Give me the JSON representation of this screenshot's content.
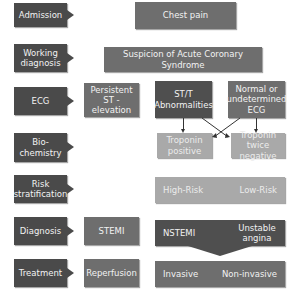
{
  "stages": [
    {
      "id": "admission",
      "label": "Admission"
    },
    {
      "id": "working_diagnosis",
      "label": "Working diagnosis"
    },
    {
      "id": "ecg",
      "label": "ECG"
    },
    {
      "id": "biochemistry",
      "label": "Bio-\nchemistry"
    },
    {
      "id": "risk",
      "label": "Risk stratification"
    },
    {
      "id": "diagnosis",
      "label": "Diagnosis"
    },
    {
      "id": "treatment",
      "label": "Treatment"
    }
  ],
  "nodes": {
    "chest_pain": "Chest pain",
    "suspicion": "Suspicion of Acute Coronary Syndrome",
    "persistent": "Persistent ST - elevation",
    "stt": "ST/T Abnormalities",
    "normal_ecg": "Normal or undetermined ECG",
    "trop_pos": "Troponin positive",
    "trop_neg": "Troponin twice negative",
    "high_risk": "High-Risk",
    "low_risk": "Low-Risk",
    "stemi": "STEMI",
    "nstemi": "NSTEMI",
    "unstable": "Unstable angina",
    "reperfusion": "Reperfusion",
    "invasive": "Invasive",
    "noninvasive": "Non-invasive"
  },
  "colors": {
    "dark": "#4f4f4f",
    "mid": "#6e6e6e",
    "light": "#a9a9a9"
  }
}
